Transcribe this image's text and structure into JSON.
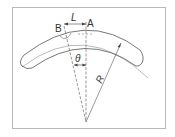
{
  "diagram": {
    "labels": {
      "point_a": "A",
      "point_b": "B",
      "arc_length": "L",
      "angle": "θ",
      "radius": "R"
    },
    "colors": {
      "line": "#555555",
      "frame": "#b8b8b8",
      "text": "#333333"
    }
  }
}
